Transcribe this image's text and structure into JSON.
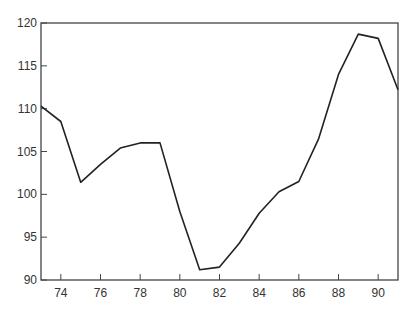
{
  "chart_data": {
    "type": "line",
    "title": "",
    "xlabel": "",
    "ylabel": "",
    "xlim": [
      73,
      91
    ],
    "ylim": [
      90,
      120
    ],
    "grid": false,
    "legend": null,
    "x": [
      73,
      74,
      75,
      76,
      77,
      78,
      79,
      80,
      81,
      82,
      83,
      84,
      85,
      86,
      87,
      88,
      89,
      90,
      91
    ],
    "series": [
      {
        "name": "series",
        "color": "#222222",
        "values": [
          110.3,
          108.5,
          101.4,
          103.5,
          105.4,
          106.0,
          106.0,
          98.0,
          91.2,
          91.5,
          94.3,
          97.8,
          100.3,
          101.5,
          106.5,
          114.0,
          118.7,
          118.2,
          112.2
        ]
      }
    ],
    "x_ticks": [
      74,
      76,
      78,
      80,
      82,
      84,
      86,
      88,
      90
    ],
    "y_ticks": [
      90,
      95,
      100,
      105,
      110,
      115,
      120
    ],
    "x_tick_labels": [
      "74",
      "76",
      "78",
      "80",
      "82",
      "84",
      "86",
      "88",
      "90"
    ],
    "y_tick_labels": [
      "90",
      "95",
      "100",
      "105",
      "110",
      "115",
      "120"
    ]
  }
}
